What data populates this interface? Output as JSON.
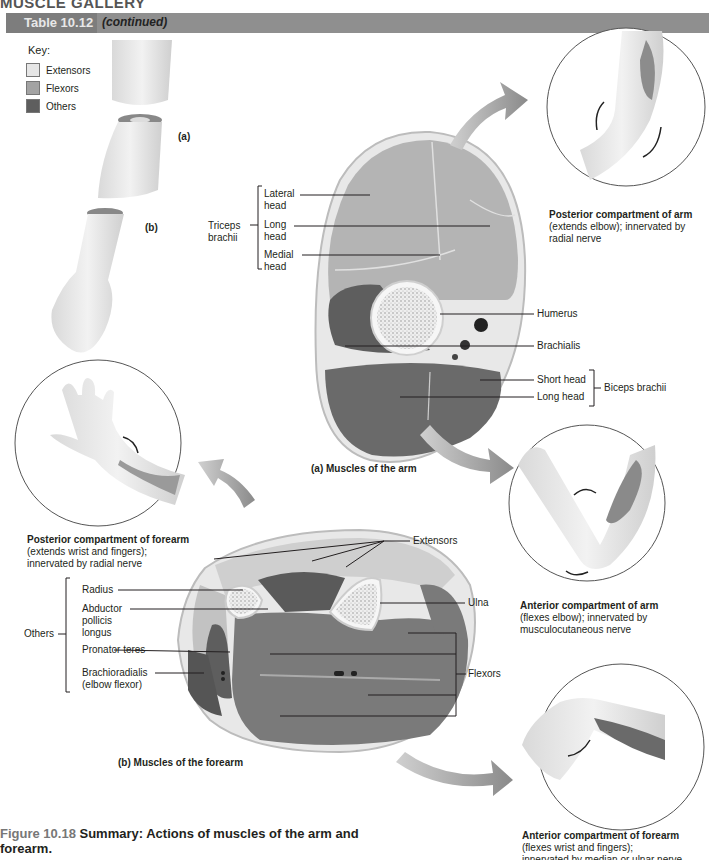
{
  "header": {
    "gallery_title": "MUSCLE GALLERY",
    "table_tag": "Table 10.12",
    "table_continued": "(continued)",
    "bar_color": "#8f8f8f",
    "tag_color": "#7d7d7d"
  },
  "key": {
    "title": "Key:",
    "items": [
      {
        "label": "Extensors",
        "color": "#e6e6e6"
      },
      {
        "label": "Flexors",
        "color": "#a3a3a3"
      },
      {
        "label": "Others",
        "color": "#5e5e5e"
      }
    ]
  },
  "limb_labels": {
    "a": "(a)",
    "b": "(b)"
  },
  "arm_section": {
    "caption": "(a) Muscles of the arm",
    "triceps_group": "Triceps brachii",
    "triceps_line1": "Triceps",
    "triceps_line2": "brachii",
    "lateral_head_1": "Lateral",
    "lateral_head_2": "head",
    "long_head_1": "Long",
    "long_head_2": "head",
    "medial_head_1": "Medial",
    "medial_head_2": "head",
    "humerus": "Humerus",
    "brachialis": "Brachialis",
    "short_head": "Short head",
    "long_head": "Long head",
    "biceps_group": "Biceps brachii"
  },
  "forearm_section": {
    "caption": "(b) Muscles of the forearm",
    "extensors": "Extensors",
    "radius": "Radius",
    "ulna": "Ulna",
    "abductor_1": "Abductor",
    "abductor_2": "pollicis",
    "abductor_3": "longus",
    "others": "Others",
    "pronator_teres": "Pronator teres",
    "brachioradialis_1": "Brachioradialis",
    "brachioradialis_2": "(elbow flexor)",
    "flexors": "Flexors"
  },
  "callouts": {
    "posterior_arm": {
      "title": "Posterior compartment of arm",
      "line1": "(extends elbow); innervated by",
      "line2": "radial nerve"
    },
    "anterior_arm": {
      "title": "Anterior compartment of arm",
      "line1": "(flexes elbow); innervated by",
      "line2": "musculocutaneous nerve"
    },
    "posterior_forearm": {
      "title": "Posterior compartment of forearm",
      "line1": "(extends wrist and fingers);",
      "line2": "innervated by radial nerve"
    },
    "anterior_forearm": {
      "title": "Anterior compartment of forearm",
      "line1": "(flexes wrist and fingers);",
      "line2": "innervated by median or ulnar nerve"
    }
  },
  "figure": {
    "number": "Figure 10.18",
    "caption_line1": "Summary: Actions of muscles of the arm and",
    "caption_line2": "forearm."
  }
}
